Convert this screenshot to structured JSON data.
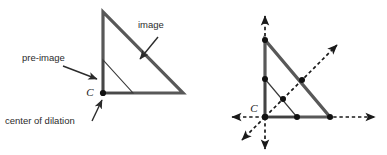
{
  "figure": {
    "labels": {
      "pre_image": "pre-image",
      "image": "image",
      "center_of_dilation": "center of dilation",
      "center_point_left": "C",
      "center_point_right": "C"
    },
    "colors": {
      "image_stroke": "#585858",
      "preimage_stroke": "#3a3a3a",
      "axis_stroke": "#1a1a1a",
      "point_fill": "#111111",
      "text": "#2b2b2b",
      "background": "#ffffff"
    },
    "left_panel": {
      "image_triangle": {
        "name": "image",
        "vertices": [
          [
            103,
            12
          ],
          [
            103,
            93
          ],
          [
            183,
            93
          ]
        ],
        "stroke_width": 3.2
      },
      "preimage_triangle": {
        "name": "pre-image",
        "vertices": [
          [
            103,
            60
          ],
          [
            103,
            93
          ],
          [
            133,
            93
          ]
        ],
        "stroke_width": 1.1
      },
      "center_point": [
        103,
        93
      ],
      "annotations": [
        {
          "text": "pre-image",
          "text_xy": [
            22,
            61
          ],
          "arrow_from": [
            63,
            66
          ],
          "arrow_to": [
            97,
            79
          ]
        },
        {
          "text": "image",
          "text_xy": [
            138,
            28
          ],
          "arrow_from": [
            158,
            37
          ],
          "arrow_to": [
            139,
            60
          ]
        },
        {
          "text": "center of dilation",
          "text_xy": [
            5,
            123
          ],
          "arrow_from": [
            92,
            120
          ],
          "arrow_to": [
            102,
            99
          ]
        }
      ]
    },
    "right_panel": {
      "center": [
        265,
        117
      ],
      "image_triangle": {
        "name": "image",
        "vertices": [
          [
            265,
            40
          ],
          [
            265,
            117
          ],
          [
            330,
            117
          ]
        ],
        "stroke_width": 3.2
      },
      "preimage_triangle": {
        "name": "pre-image",
        "vertices": [
          [
            265,
            79
          ],
          [
            265,
            117
          ],
          [
            297,
            117
          ]
        ],
        "stroke_width": 1.1
      },
      "rays": [
        {
          "name": "ray-up",
          "from": [
            265,
            117
          ],
          "to": [
            265,
            14
          ]
        },
        {
          "name": "ray-down",
          "from": [
            265,
            117
          ],
          "to": [
            265,
            150
          ]
        },
        {
          "name": "ray-left",
          "from": [
            265,
            117
          ],
          "to": [
            231,
            117
          ]
        },
        {
          "name": "ray-right",
          "from": [
            265,
            117
          ],
          "to": [
            376,
            117
          ]
        },
        {
          "name": "ray-up-right",
          "from": [
            265,
            117
          ],
          "to": [
            338,
            44
          ]
        },
        {
          "name": "ray-down-left",
          "from": [
            265,
            117
          ],
          "to": [
            241,
            141
          ]
        }
      ],
      "points": [
        {
          "name": "image-apex",
          "xy": [
            265,
            40
          ]
        },
        {
          "name": "preimage-apex",
          "xy": [
            265,
            79
          ]
        },
        {
          "name": "center",
          "xy": [
            265,
            117
          ]
        },
        {
          "name": "preimage-base-vertex",
          "xy": [
            297,
            117
          ]
        },
        {
          "name": "image-base-vertex",
          "xy": [
            330,
            117
          ]
        },
        {
          "name": "preimage-hypotenuse-pt",
          "xy": [
            283,
            99
          ]
        },
        {
          "name": "image-hypotenuse-pt",
          "xy": [
            302,
            80
          ]
        }
      ]
    }
  }
}
